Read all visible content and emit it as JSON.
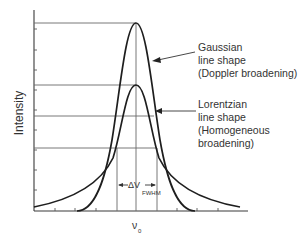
{
  "diagram": {
    "y_axis_label": "Intensity",
    "x_axis_label": "ν",
    "x_axis_label_sub": "0",
    "fwhm_label": "ΔV",
    "fwhm_label_sub": "FWHM",
    "gaussian": {
      "line1": "Gaussian",
      "line2": "line shape",
      "line3": "(Doppler broadening)"
    },
    "lorentzian": {
      "line1": "Lorentzian",
      "line2": "line shape",
      "line3": "(Homogeneous",
      "line4": "broadening)"
    },
    "colors": {
      "curve": "#1e1e1e",
      "grid": "#6a6a6a",
      "text": "#333333",
      "background": "#ffffff"
    }
  }
}
